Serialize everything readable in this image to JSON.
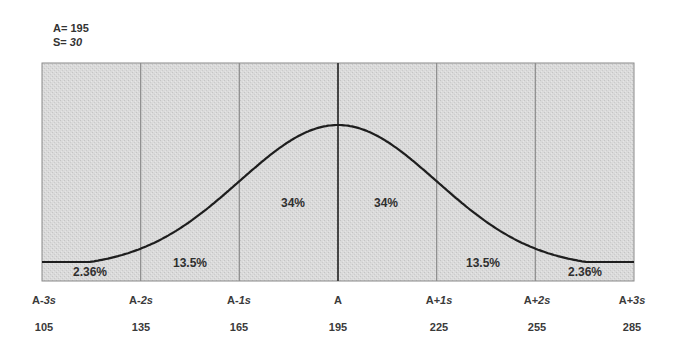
{
  "params": {
    "mean_label": "A=",
    "mean_value": "195",
    "sd_label": "S=",
    "sd_value": "30"
  },
  "colors": {
    "box_fill": "#d9d9d9",
    "box_border": "#8a8a8a",
    "divider": "#8c8c8c",
    "center_divider": "#444444",
    "curve": "#1e1e1e"
  },
  "chart_data": {
    "type": "line",
    "xlabel": "",
    "ylabel": "",
    "mean": 195,
    "sd": 30,
    "grid": false,
    "x_ticks": [
      {
        "label_base": "A",
        "label_sign": "-",
        "label_mult": "3s",
        "value": "105"
      },
      {
        "label_base": "A",
        "label_sign": "-",
        "label_mult": "2s",
        "value": "135"
      },
      {
        "label_base": "A",
        "label_sign": "-",
        "label_mult": "1s",
        "value": "165"
      },
      {
        "label_base": "A",
        "label_sign": "",
        "label_mult": "",
        "value": "195"
      },
      {
        "label_base": "A",
        "label_sign": "+",
        "label_mult": "1s",
        "value": "225"
      },
      {
        "label_base": "A",
        "label_sign": "+",
        "label_mult": "2s",
        "value": "255"
      },
      {
        "label_base": "A",
        "label_sign": "+",
        "label_mult": "3s",
        "value": "285"
      }
    ],
    "regions": [
      {
        "range": [
          "A-3s",
          "A-2s"
        ],
        "percent": "2.36%"
      },
      {
        "range": [
          "A-2s",
          "A-1s"
        ],
        "percent": "13.5%"
      },
      {
        "range": [
          "A-1s",
          "A"
        ],
        "percent": "34%"
      },
      {
        "range": [
          "A",
          "A+1s"
        ],
        "percent": "34%"
      },
      {
        "range": [
          "A+1s",
          "A+2s"
        ],
        "percent": "13.5%"
      },
      {
        "range": [
          "A+2s",
          "A+3s"
        ],
        "percent": "2.36%"
      }
    ],
    "x_range": [
      105,
      285
    ],
    "curve": "bell-shaped normal density curve peaking at A"
  }
}
